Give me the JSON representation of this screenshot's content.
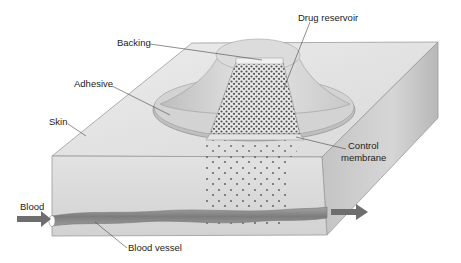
{
  "diagram": {
    "labels": {
      "drug_reservoir": "Drug reservoir",
      "backing": "Backing",
      "adhesive": "Adhesive",
      "skin": "Skin",
      "control_membrane_line1": "Control",
      "control_membrane_line2": "membrane",
      "blood": "Blood",
      "blood_vessel": "Blood vessel"
    },
    "colors": {
      "skin_top": "#e4e4e4",
      "skin_front": "#d8d8d8",
      "skin_side": "#bdbdbd",
      "patch": "#cfcfcf",
      "blood_vessel": "#8a8a8a",
      "arrow": "#6e6e6e",
      "drug_dot": "#555555"
    }
  }
}
